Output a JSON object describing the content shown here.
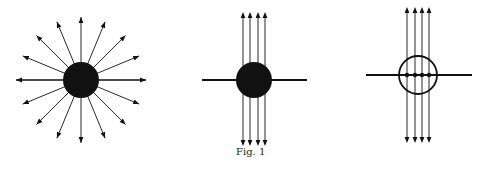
{
  "caption": "Fig. 1",
  "colors": {
    "ink": "#111111",
    "background": "#ffffff"
  },
  "panels": [
    {
      "name": "radial-field",
      "description": "Filled sphere with 16 arrows pointing radially outward",
      "center": [
        81,
        80
      ],
      "radius": 18,
      "arrow_count": 16,
      "arrow_length": 65
    },
    {
      "name": "uniform-field-through-solid-sphere",
      "description": "Filled sphere on horizontal line with 4 vertical double-ended arrow lines passing through",
      "center": [
        254,
        80
      ],
      "radius": 18,
      "line_x": [
        243,
        250,
        258,
        265
      ]
    },
    {
      "name": "uniform-field-through-hollow-sphere",
      "description": "Hollow circle on horizontal line with 4 vertical double-ended arrow lines and dots on intersection",
      "center": [
        418,
        75
      ],
      "radius": 19,
      "line_x": [
        407,
        415,
        422,
        429
      ]
    }
  ]
}
